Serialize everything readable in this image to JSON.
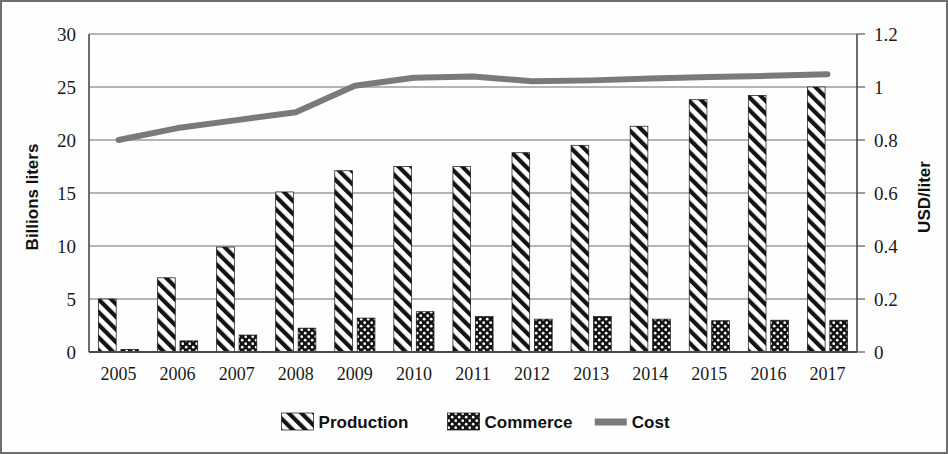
{
  "chart_data": {
    "type": "bar",
    "title": "",
    "subtitle": "",
    "categories": [
      "2005",
      "2006",
      "2007",
      "2008",
      "2009",
      "2010",
      "2011",
      "2012",
      "2013",
      "2014",
      "2015",
      "2016",
      "2017"
    ],
    "xlabel": "",
    "ylabel": "Billions liters",
    "y2label": "USD/liter",
    "ylim": [
      0,
      30
    ],
    "y2lim": [
      0,
      1.2
    ],
    "yticks": [
      0,
      5,
      10,
      15,
      20,
      25,
      30
    ],
    "ytick_labels": [
      "0",
      "5",
      "10",
      "15",
      "20",
      "25",
      "30"
    ],
    "y2ticks": [
      0,
      0.2,
      0.4,
      0.6,
      0.8,
      1,
      1.2
    ],
    "y2tick_labels": [
      "0",
      "0.2",
      "0.4",
      "0.6",
      "0.8",
      "1",
      "1.2"
    ],
    "grid": true,
    "legend_position": "bottom",
    "series": [
      {
        "name": "Production",
        "type": "bar",
        "axis": "left",
        "pattern": "diagonal-hatch",
        "color": "#1a1a1a",
        "values": [
          5.0,
          7.0,
          9.9,
          15.1,
          17.1,
          17.5,
          17.5,
          18.8,
          19.5,
          21.3,
          23.8,
          24.2,
          25.0
        ]
      },
      {
        "name": "Commerce",
        "type": "bar",
        "axis": "left",
        "pattern": "dotted-fill",
        "color": "#161616",
        "values": [
          0.25,
          1.05,
          1.6,
          2.25,
          3.2,
          3.8,
          3.35,
          3.1,
          3.35,
          3.1,
          2.95,
          3.0,
          3.0
        ]
      },
      {
        "name": "Cost",
        "type": "line",
        "axis": "right",
        "color": "#7a7a7a",
        "values": [
          0.8,
          0.845,
          0.875,
          0.905,
          1.005,
          1.035,
          1.04,
          1.022,
          1.025,
          1.032,
          1.038,
          1.042,
          1.048
        ]
      }
    ]
  },
  "legend": {
    "items": [
      {
        "label": "Production",
        "swatch": "diagonal-hatch"
      },
      {
        "label": "Commerce",
        "swatch": "dotted-fill"
      },
      {
        "label": "Cost",
        "swatch": "line"
      }
    ]
  },
  "colors": {
    "axis": "#4a4a4a",
    "grid": "#6a6a6a",
    "bar": "#1a1a1a",
    "line": "#7a7a7a",
    "border": "#6f6f6f",
    "text": "#111111"
  }
}
